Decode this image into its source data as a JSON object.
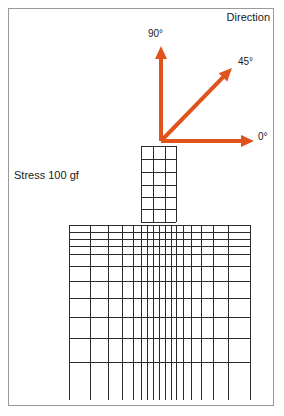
{
  "figure": {
    "title_label": "Direction",
    "stress_label": "Stress 100 gf",
    "frame_color": "#9a9a9a",
    "background_color": "#ffffff"
  },
  "arrows": {
    "color": "#e0531c",
    "origin": {
      "x": 161,
      "y": 141
    },
    "items": [
      {
        "name": "arrow-90",
        "label": "90°",
        "angle_deg": 90,
        "tip": {
          "x": 161,
          "y": 46
        }
      },
      {
        "name": "arrow-45",
        "label": "45°",
        "angle_deg": 45,
        "tip": {
          "x": 232,
          "y": 68
        }
      },
      {
        "name": "arrow-0",
        "label": "0°",
        "angle_deg": 0,
        "tip": {
          "x": 254,
          "y": 141
        }
      }
    ]
  },
  "mesh": {
    "line_color": "#2b2b2b",
    "line_width": 1,
    "indenter": {
      "name": "indenter-column",
      "x_lines": [
        141,
        153,
        165,
        176
      ],
      "y_lines": [
        146,
        159,
        172,
        185,
        197,
        209,
        222
      ]
    },
    "substrate": {
      "name": "substrate-block",
      "x_lines": [
        69,
        90,
        108,
        122,
        133,
        141,
        147,
        153,
        159,
        165,
        171,
        176,
        183,
        191,
        201,
        213,
        228,
        250
      ],
      "y_lines": [
        225,
        232,
        239,
        246,
        254,
        266,
        281,
        298,
        317,
        338,
        362
      ],
      "extension_bottom": 400
    }
  },
  "chart_data": {
    "type": "diagram",
    "title": "Direction",
    "annotations": [
      "Direction",
      "Stress 100 gf",
      "90°",
      "45°",
      "0°"
    ],
    "directions_deg": [
      0,
      45,
      90
    ]
  }
}
